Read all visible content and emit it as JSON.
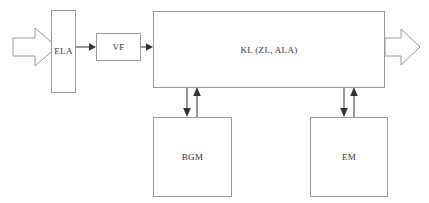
{
  "diagram": {
    "type": "block-flow-diagram",
    "colors": {
      "box_border": "#9a9a9a",
      "arrow": "#333333",
      "background": "#ffffff",
      "text": "#333333"
    },
    "blocks": [
      {
        "id": "ela",
        "label": "ELA"
      },
      {
        "id": "vf",
        "label": "VF"
      },
      {
        "id": "kl",
        "label": "KL (ZL, ALA)"
      },
      {
        "id": "bgm",
        "label": "BGM"
      },
      {
        "id": "em",
        "label": "EM"
      }
    ],
    "arrows": [
      {
        "id": "input",
        "kind": "block-arrow",
        "direction": "right",
        "from": "",
        "to": "ela"
      },
      {
        "id": "ela-vf",
        "kind": "line-arrow",
        "direction": "right",
        "from": "ela",
        "to": "vf"
      },
      {
        "id": "vf-kl",
        "kind": "line-arrow",
        "direction": "right",
        "from": "vf",
        "to": "kl"
      },
      {
        "id": "output",
        "kind": "block-arrow",
        "direction": "right",
        "from": "kl",
        "to": ""
      },
      {
        "id": "kl-bgm",
        "kind": "line-arrow",
        "direction": "down",
        "from": "kl",
        "to": "bgm"
      },
      {
        "id": "bgm-kl",
        "kind": "line-arrow",
        "direction": "up",
        "from": "bgm",
        "to": "kl"
      },
      {
        "id": "kl-em",
        "kind": "line-arrow",
        "direction": "down",
        "from": "kl",
        "to": "em"
      },
      {
        "id": "em-kl",
        "kind": "line-arrow",
        "direction": "up",
        "from": "em",
        "to": "kl"
      }
    ]
  }
}
